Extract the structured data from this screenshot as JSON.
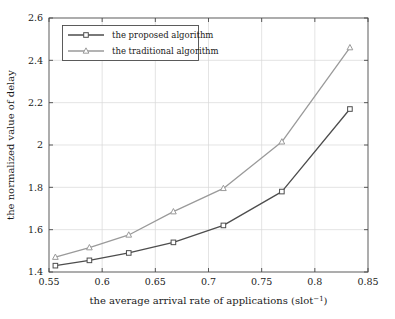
{
  "chart_data": {
    "type": "line",
    "title": "",
    "xlabel": "the average arrival rate of applications (slot⁻¹)",
    "xlabel_main": "the average arrival rate of applications (slot",
    "xlabel_sup": "−1",
    "xlabel_tail": ")",
    "ylabel": "the normalized value of delay",
    "xlim": [
      0.55,
      0.85
    ],
    "ylim": [
      1.4,
      2.6
    ],
    "grid": true,
    "legend_position": "upper-left",
    "xticks": [
      "0.55",
      "0.6",
      "0.65",
      "0.7",
      "0.75",
      "0.8",
      "0.85"
    ],
    "xtick_values": [
      0.55,
      0.6,
      0.65,
      0.7,
      0.75,
      0.8,
      0.85
    ],
    "yticks": [
      "1.4",
      "1.6",
      "1.8",
      "2",
      "2.2",
      "2.4",
      "2.6"
    ],
    "ytick_values": [
      1.4,
      1.6,
      1.8,
      2.0,
      2.2,
      2.4,
      2.6
    ],
    "x": [
      0.556,
      0.588,
      0.625,
      0.667,
      0.714,
      0.769,
      0.833
    ],
    "series": [
      {
        "name": "the proposed algorithm",
        "marker": "square",
        "color": "#4d4d4d",
        "values": [
          1.43,
          1.455,
          1.49,
          1.54,
          1.62,
          1.78,
          2.17
        ]
      },
      {
        "name": "the traditional algorithm",
        "marker": "triangle",
        "color": "#9a9a9a",
        "values": [
          1.47,
          1.515,
          1.575,
          1.685,
          1.795,
          2.015,
          2.46
        ]
      }
    ]
  },
  "legend": {
    "entries": [
      {
        "label": "the proposed algorithm",
        "marker": "square-marker-icon"
      },
      {
        "label": "the traditional algorithm",
        "marker": "triangle-marker-icon"
      }
    ]
  },
  "colors": {
    "proposed": "#4d4d4d",
    "traditional": "#9a9a9a",
    "grid": "#d9d9d9",
    "axis": "#4a4a4a",
    "text": "#1a1a1a",
    "background": "#ffffff"
  }
}
